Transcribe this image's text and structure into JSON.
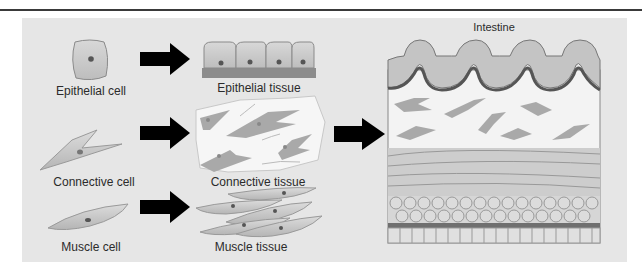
{
  "figure": {
    "title": "Intestine",
    "rows": [
      {
        "cell_label": "Epithelial cell",
        "tissue_label": "Epithelial tissue"
      },
      {
        "cell_label": "Connective cell",
        "tissue_label": "Connective tissue"
      },
      {
        "cell_label": "Muscle cell",
        "tissue_label": "Muscle tissue"
      }
    ],
    "organ_label": "Intestine"
  },
  "colors": {
    "panel": "#e6e6e6",
    "cell_fill": "#c9c9c9",
    "nucleus": "#555555",
    "basement": "#7a7a7a",
    "arrow": "#000000",
    "connective_bg": "#f7f7f7"
  }
}
